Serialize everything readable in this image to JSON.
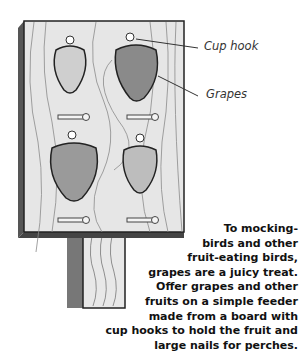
{
  "labels": {
    "cup_hook": "Cup hook",
    "grapes": "Grapes"
  },
  "caption": {
    "lines": [
      "To mocking-",
      "birds and other",
      "fruit-eating birds,",
      "grapes are a juicy treat.",
      "Offer grapes and other",
      "fruits on a simple feeder",
      "made from a board with",
      "cup hooks to hold the fruit and",
      "large nails for perches."
    ]
  },
  "colors": {
    "board": "#e6e6e6",
    "outline": "#222222",
    "grape_light": "#cfcfcf",
    "grape_dark": "#8a8a8a"
  }
}
